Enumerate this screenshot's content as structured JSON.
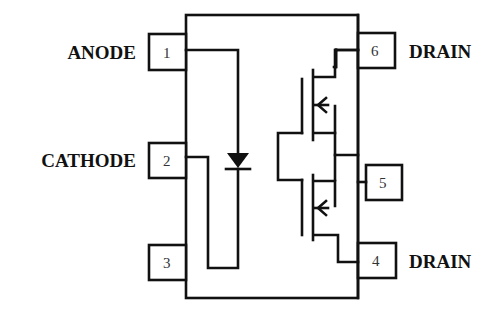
{
  "diagram": {
    "title": "",
    "type": "optocoupler-pinout",
    "left_pins": [
      {
        "number": "1",
        "label": "ANODE"
      },
      {
        "number": "2",
        "label": "CATHODE"
      },
      {
        "number": "3",
        "label": ""
      }
    ],
    "right_pins": [
      {
        "number": "6",
        "label": "DRAIN"
      },
      {
        "number": "5",
        "label": ""
      },
      {
        "number": "4",
        "label": "DRAIN"
      }
    ],
    "components": [
      "LED diode (pins 1-2)",
      "dual MOSFET output (pins 4-5-6)"
    ],
    "colors": {
      "line": "#111111",
      "background": "#ffffff"
    }
  }
}
